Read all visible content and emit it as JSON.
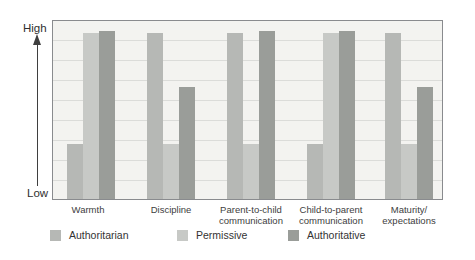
{
  "chart_data": {
    "type": "bar",
    "title": "",
    "subtitle": "",
    "categories": [
      "Warmth",
      "Discipline",
      "Parent-to-child communication",
      "Child-to-parent communication",
      "Maturity/expectations"
    ],
    "category_display_lines": [
      [
        "Warmth"
      ],
      [
        "Discipline"
      ],
      [
        "Parent-to-child",
        "communication"
      ],
      [
        "Child-to-parent",
        "communication"
      ],
      [
        "Maturity/",
        "expectations"
      ]
    ],
    "series": [
      {
        "name": "Authoritarian",
        "color": "#b6b8b5",
        "values": [
          0.31,
          0.93,
          0.93,
          0.31,
          0.93
        ],
        "levels": [
          "low",
          "high",
          "high",
          "low",
          "high"
        ]
      },
      {
        "name": "Permissive",
        "color": "#c7c9c6",
        "values": [
          0.93,
          0.31,
          0.31,
          0.93,
          0.31
        ],
        "levels": [
          "high",
          "low",
          "low",
          "high",
          "low"
        ]
      },
      {
        "name": "Authoritative",
        "color": "#9a9d99",
        "values": [
          0.945,
          0.63,
          0.945,
          0.945,
          0.63
        ],
        "levels": [
          "high",
          "medium-high",
          "high",
          "high",
          "medium-high"
        ]
      }
    ],
    "xlabel": "",
    "ylabel": "",
    "y_axis": {
      "type": "qualitative",
      "top_label": "High",
      "bottom_label": "Low",
      "arrow": "up"
    },
    "ylim": [
      0,
      1
    ],
    "grid": true,
    "gridline_count": 8,
    "legend_position": "bottom"
  },
  "colors": {
    "plot_background": "#f3f3f0",
    "gridline": "#dbdcd9",
    "plot_border": "#898b8e",
    "axis_arrow": "#3f3f3f",
    "text": "#3b3b3b"
  }
}
